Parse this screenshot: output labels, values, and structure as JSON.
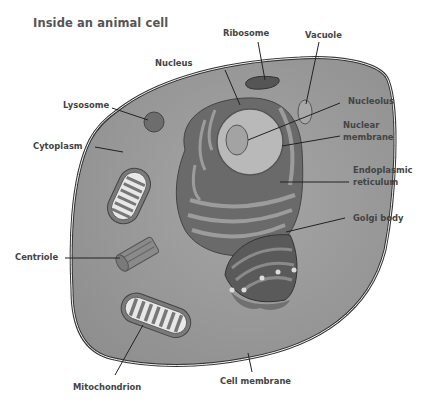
{
  "title": "Inside an animal cell",
  "labels": {
    "ribosome": "Ribosome",
    "vacuole": "Vacuole",
    "nucleus": "Nucleus",
    "lysosome": "Lysosome",
    "nucleolus": "Nucleolus",
    "nuclear_membrane_1": "Nuclear",
    "nuclear_membrane_2": "membrane",
    "cytoplasm": "Cytoplasm",
    "er_1": "Endoplasmic",
    "er_2": "reticulum",
    "golgi": "Golgi body",
    "centriole": "Centriole",
    "mitochondrion": "Mitochondrion",
    "cell_membrane": "Cell membrane"
  },
  "colors": {
    "cytoplasm": "#9a9a9a",
    "membrane": "#3a3a3a",
    "nucleus": "#b8b8b8",
    "organelle_dark": "#5e5e5e",
    "organelle_mid": "#7d7d7d",
    "text": "#444444"
  }
}
